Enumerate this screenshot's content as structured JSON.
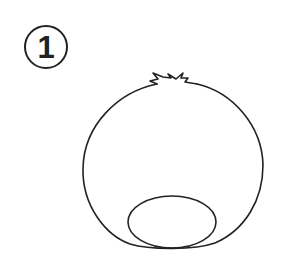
{
  "step": {
    "number": "1"
  },
  "drawing": {
    "subject": "round-body-with-tuft-and-bottom-ellipse",
    "stroke_color": "#222222",
    "fill_color": "#ffffff"
  }
}
